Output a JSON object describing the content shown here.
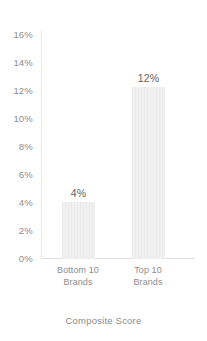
{
  "chart_data": {
    "type": "bar",
    "title": "",
    "subtitle": "",
    "categories": [
      "Bottom 10 Brands",
      "Top 10 Brands"
    ],
    "category_lines": [
      [
        "Bottom 10",
        "Brands"
      ],
      [
        "Top 10",
        "Brands"
      ]
    ],
    "values": [
      4,
      12
    ],
    "value_labels": [
      "4%",
      "12%"
    ],
    "xlabel": "Composite Score",
    "ylabel": "",
    "ylim": [
      0,
      16
    ],
    "ytick_step": 2,
    "ytick_labels": [
      "16%",
      "14%",
      "12%",
      "10%",
      "8%",
      "6%",
      "4%",
      "2%",
      "0%"
    ],
    "ytick_values": [
      16,
      14,
      12,
      10,
      8,
      6,
      4,
      2,
      0
    ],
    "grid": false,
    "legend": null,
    "units": "percent",
    "colors": {
      "bar_fill": "#f1f1f1",
      "bar_stripe": "#e4e4e4",
      "axis_line": "#e0e0e0",
      "tick_text": "#8d8d8d",
      "value_text": "#5f5f5f",
      "background": "#ffffff"
    }
  }
}
